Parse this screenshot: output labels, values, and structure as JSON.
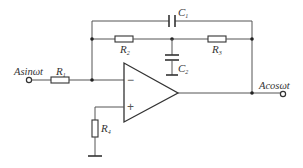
{
  "diagram": {
    "type": "op-amp circuit (phase shifter / filter)",
    "input_label": "Asinωt",
    "output_label": "Acosωt",
    "components": {
      "R1": {
        "letter": "R",
        "sub": "1"
      },
      "R2": {
        "letter": "R",
        "sub": "2"
      },
      "R3": {
        "letter": "R",
        "sub": "3"
      },
      "R4": {
        "letter": "R",
        "sub": "4"
      },
      "C1": {
        "letter": "C",
        "sub": "1"
      },
      "C2": {
        "letter": "C",
        "sub": "2"
      }
    },
    "opamp": {
      "minus": "−",
      "plus": "+"
    }
  }
}
